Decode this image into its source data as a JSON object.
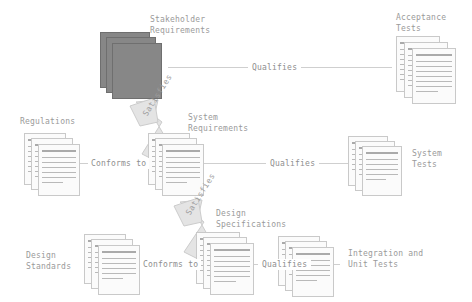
{
  "diagram": {
    "type": "requirements-traceability-diagram",
    "colors": {
      "background": "#ffffff",
      "label_text": "#9a9a9a",
      "connector_line": "#cfcfcf",
      "document_fill": "#fbfbfb",
      "document_border": "#c9c9c9",
      "document_rule": "#b9b9b9",
      "highlight_stack_fill": "#878787",
      "arrow_fill": "#e2e2e2",
      "arrow_border": "#cbcbcb"
    },
    "nodes": [
      {
        "id": "stakeholder-requirements",
        "label": "Stakeholder\nRequirements",
        "line1": "Stakeholder",
        "line2": "Requirements",
        "style": "filled"
      },
      {
        "id": "acceptance-tests",
        "label": "Acceptance\nTests",
        "line1": "Acceptance",
        "line2": "Tests",
        "style": "outline"
      },
      {
        "id": "regulations",
        "label": "Regulations",
        "line1": "Regulations",
        "line2": "",
        "style": "outline"
      },
      {
        "id": "system-requirements",
        "label": "System\nRequirements",
        "line1": "System",
        "line2": "Requirements",
        "style": "outline"
      },
      {
        "id": "system-tests",
        "label": "System\nTests",
        "line1": "System",
        "line2": "Tests",
        "style": "outline"
      },
      {
        "id": "design-standards",
        "label": "Design\nStandards",
        "line1": "Design",
        "line2": "Standards",
        "style": "outline"
      },
      {
        "id": "design-specifications",
        "label": "Design\nSpecifications",
        "line1": "Design",
        "line2": "Specifications",
        "style": "outline"
      },
      {
        "id": "integration-unit-tests",
        "label": "Integration and\nUnit Tests",
        "line1": "Integration and",
        "line2": "Unit Tests",
        "style": "outline"
      }
    ],
    "edges": [
      {
        "id": "qualifies-acceptance",
        "label": "Qualifies",
        "from": "acceptance-tests",
        "to": "stakeholder-requirements",
        "orientation": "horizontal"
      },
      {
        "id": "qualifies-system",
        "label": "Qualifies",
        "from": "system-tests",
        "to": "system-requirements",
        "orientation": "horizontal"
      },
      {
        "id": "qualifies-integration",
        "label": "Qualifies",
        "from": "integration-unit-tests",
        "to": "design-specifications",
        "orientation": "horizontal"
      },
      {
        "id": "conforms-to-regulations",
        "label": "Conforms to",
        "from": "system-requirements",
        "to": "regulations",
        "orientation": "horizontal"
      },
      {
        "id": "conforms-to-standards",
        "label": "Conforms to",
        "from": "design-specifications",
        "to": "design-standards",
        "orientation": "horizontal"
      },
      {
        "id": "satisfies-upper",
        "label": "Satisfies",
        "from": "system-requirements",
        "to": "stakeholder-requirements",
        "orientation": "diagonal"
      },
      {
        "id": "satisfies-lower",
        "label": "Satisfies",
        "from": "design-specifications",
        "to": "system-requirements",
        "orientation": "diagonal"
      }
    ]
  }
}
